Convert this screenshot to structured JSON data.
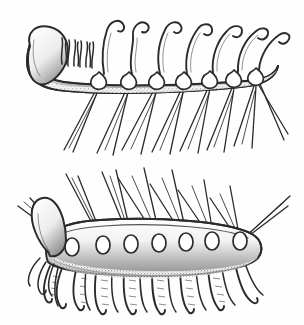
{
  "plate": {
    "title": "Hallucigenia reconstruction plate",
    "medium": "pen-and-ink stipple line drawing",
    "background_color": "#fefefe",
    "ink_color": "#2b2b2b",
    "width": 304,
    "height": 325,
    "panel_count": 2,
    "caption": "",
    "labels": []
  },
  "panels": [
    {
      "id": "upper",
      "name": "upper-figure",
      "description": "Hallucigenia with dorsal curved hook-tipped tentacles and ventral paired needle spines",
      "orientation": "spines-down-tentacles-up",
      "bbox": {
        "x": 18,
        "y": 8,
        "width": 272,
        "height": 148
      },
      "head": {
        "position": "left",
        "shape": "bulbous club",
        "bbox": {
          "x": 24,
          "y": 28,
          "width": 62,
          "height": 60
        },
        "fringe_count": 9,
        "fringe_description": "tuft of short wavy filaments behind head"
      },
      "trunk": {
        "shape": "crescent tapering to right",
        "shading": "stipple along lower margin",
        "segment_count": 7
      },
      "tail": {
        "position": "right",
        "shape": "upturned taper"
      },
      "tentacles": {
        "count": 7,
        "description": "long dorsal tentacles curving right with recurved hook tips",
        "tip": "hook",
        "x_positions": [
          105,
          134,
          162,
          189,
          215,
          240,
          262
        ]
      },
      "sockets": {
        "count": 7,
        "shape": "teardrop",
        "x_positions": [
          97,
          127,
          155,
          182,
          208,
          232,
          254
        ]
      },
      "spines": {
        "count": 14,
        "pairs": 7,
        "description": "paired slender needle spines splaying downward in V pattern",
        "texture": "fine transverse striations"
      }
    },
    {
      "id": "lower",
      "name": "lower-figure",
      "description": "Hallucigenia inverted with dorsal paired needle spines and ventral annulated legs ending in claws",
      "orientation": "spines-up-legs-down",
      "bbox": {
        "x": 10,
        "y": 168,
        "width": 280,
        "height": 152
      },
      "head": {
        "position": "left",
        "shape": "bulbous club angled up-left",
        "bbox": {
          "x": 22,
          "y": 196,
          "width": 58,
          "height": 70
        }
      },
      "trunk": {
        "shape": "low arch tapering to right",
        "shading": "dense stipple on lower half",
        "segment_count": 7
      },
      "tail": {
        "position": "right",
        "shape": "short taper"
      },
      "sockets": {
        "count": 7,
        "shape": "ring",
        "x_positions": [
          72,
          103,
          131,
          159,
          186,
          212,
          238
        ]
      },
      "spines": {
        "count": 14,
        "pairs": 7,
        "description": "paired long needle spines radiating upward and outward",
        "texture": "fine transverse striations"
      },
      "legs": {
        "count": 9,
        "description": "annulated tubular legs hanging down, each ending in a small recurved claw",
        "tip": "claw",
        "texture": "transverse annulations"
      }
    }
  ]
}
